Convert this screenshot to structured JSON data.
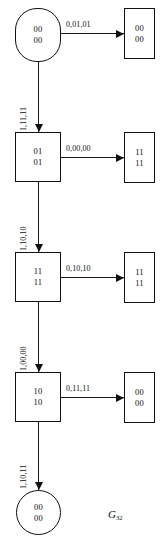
{
  "diagram": {
    "caption_symbol": "G",
    "caption_subscript": "32",
    "stroke_color": "#111111",
    "background_color": "#ffffff"
  },
  "nodes": {
    "start": {
      "line1": "00",
      "line2": "00"
    },
    "s1": {
      "line1": "01",
      "line2": "01"
    },
    "s2": {
      "line1": "11",
      "line2": "11"
    },
    "s3": {
      "line1": "10",
      "line2": "10"
    },
    "end": {
      "line1": "00",
      "line2": "00"
    },
    "out1": {
      "line1": "00",
      "line2": "00"
    },
    "out2": {
      "line1": "11",
      "line2": "11"
    },
    "out3": {
      "line1": "11",
      "line2": "11"
    },
    "out4": {
      "line1": "00",
      "line2": "00"
    }
  },
  "edges": {
    "h1": {
      "label": "0,01,01"
    },
    "h2": {
      "label": "0,00,00"
    },
    "h3": {
      "label": "0,10,10"
    },
    "h4": {
      "label": "0,11,11"
    },
    "v1": {
      "label": "1,11,11"
    },
    "v2": {
      "label": "1,10,10"
    },
    "v3": {
      "label": "1,00,00"
    },
    "v4": {
      "label": "1,10,11"
    }
  }
}
